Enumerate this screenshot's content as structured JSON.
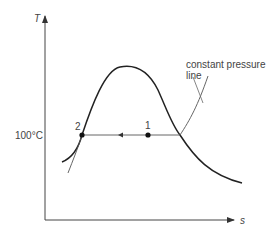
{
  "diagram": {
    "type": "T-s diagram",
    "axes": {
      "y_label": "T",
      "x_label": "s"
    },
    "temperature_marker": "100°C",
    "points": [
      {
        "id": "point-1",
        "label": "1"
      },
      {
        "id": "point-2",
        "label": "2"
      }
    ],
    "annotation": "constant pressure line",
    "annotation_lines": [
      "constant pressure",
      "line"
    ],
    "process_direction": "from 1 to 2 (leftward)"
  }
}
